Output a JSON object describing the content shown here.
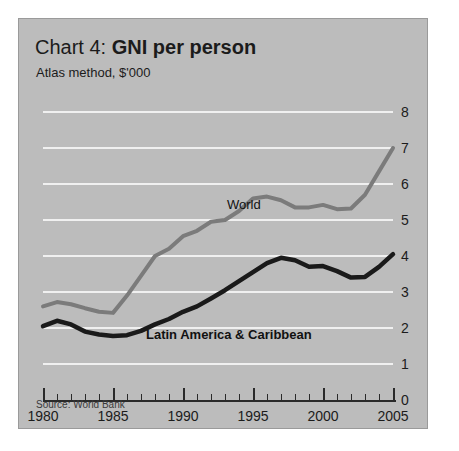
{
  "panel": {
    "title_prefix": "Chart 4: ",
    "title_main": "GNI per person",
    "subtitle": "Atlas method, $'000",
    "source": "Source: World Bank",
    "background_color": "#bcbcbc",
    "gridline_color": "#f0f0f0"
  },
  "annotations": {
    "world_label": "World",
    "latam_label": "Latin America & Caribbean"
  },
  "chart_data": {
    "type": "line",
    "title": "Chart 4: GNI per person",
    "subtitle": "Atlas method, $'000",
    "source": "Source: World Bank",
    "xlabel": "",
    "ylabel": "Atlas method, $'000",
    "xlim": [
      1980,
      2005
    ],
    "ylim": [
      0,
      8
    ],
    "grid": true,
    "legend": "inline-annotations",
    "y_ticks": [
      0,
      1,
      2,
      3,
      4,
      5,
      6,
      7,
      8
    ],
    "y_tick_labels": [
      "0",
      "1",
      "2",
      "3",
      "4",
      "5",
      "6",
      "7",
      "8"
    ],
    "x_ticks": [
      1980,
      1981,
      1982,
      1983,
      1984,
      1985,
      1986,
      1987,
      1988,
      1989,
      1990,
      1991,
      1992,
      1993,
      1994,
      1995,
      1996,
      1997,
      1998,
      1999,
      2000,
      2001,
      2002,
      2003,
      2004,
      2005
    ],
    "x_tick_labels_major": [
      "1980",
      "1985",
      "1990",
      "1995",
      "2000",
      "2005"
    ],
    "x": [
      1980,
      1981,
      1982,
      1983,
      1984,
      1985,
      1986,
      1987,
      1988,
      1989,
      1990,
      1991,
      1992,
      1993,
      1994,
      1995,
      1996,
      1997,
      1998,
      1999,
      2000,
      2001,
      2002,
      2003,
      2004,
      2005
    ],
    "series": [
      {
        "name": "World",
        "color": "#7b7b7b",
        "values": [
          2.6,
          2.72,
          2.66,
          2.55,
          2.45,
          2.42,
          2.9,
          3.45,
          4.0,
          4.2,
          4.55,
          4.7,
          4.95,
          5.0,
          5.25,
          5.6,
          5.65,
          5.55,
          5.35,
          5.35,
          5.42,
          5.3,
          5.32,
          5.7,
          6.35,
          7.0
        ]
      },
      {
        "name": "Latin America & Caribbean",
        "color": "#1a1a1a",
        "values": [
          2.05,
          2.2,
          2.1,
          1.9,
          1.82,
          1.78,
          1.8,
          1.92,
          2.1,
          2.25,
          2.45,
          2.6,
          2.82,
          3.05,
          3.3,
          3.55,
          3.8,
          3.95,
          3.88,
          3.7,
          3.72,
          3.58,
          3.4,
          3.42,
          3.7,
          4.05
        ]
      }
    ]
  }
}
